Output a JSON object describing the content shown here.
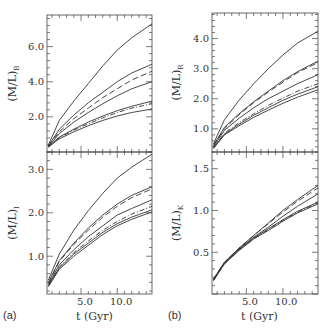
{
  "panels": {
    "a": {
      "label": "(a)",
      "xlabel": "t (Gyr)",
      "xticks": [
        "5.0",
        "10.0"
      ]
    },
    "b": {
      "label": "(b)",
      "xlabel": "t (Gyr)",
      "xticks": [
        "5.0",
        "10.0"
      ]
    }
  },
  "chart_data": [
    {
      "type": "line",
      "panel": "a-top",
      "ylabel": "(M/L)_B",
      "ylabel_main": "(M/L)",
      "ylabel_sub": "B",
      "xlabel": "",
      "yticks": [
        "2.0",
        "4.0",
        "6.0"
      ],
      "xlim": [
        0.3,
        14.8
      ],
      "ylim": [
        0.0,
        7.8
      ],
      "grid": false,
      "x": [
        0.5,
        2,
        4,
        6,
        8,
        10,
        12,
        14.8
      ],
      "series": [
        {
          "name": "solid-1",
          "style": "solid",
          "values": [
            0.4,
            1.8,
            2.9,
            3.9,
            4.9,
            5.8,
            6.5,
            7.3
          ]
        },
        {
          "name": "solid-2",
          "style": "solid",
          "values": [
            0.35,
            1.3,
            2.1,
            2.8,
            3.4,
            4.0,
            4.5,
            5.0
          ]
        },
        {
          "name": "dashed-1",
          "style": "dashed",
          "values": [
            0.35,
            1.15,
            1.9,
            2.5,
            3.1,
            3.6,
            4.1,
            4.6
          ]
        },
        {
          "name": "solid-3",
          "style": "solid",
          "values": [
            0.3,
            1.05,
            1.7,
            2.25,
            2.75,
            3.2,
            3.6,
            4.0
          ]
        },
        {
          "name": "solid-4",
          "style": "solid",
          "values": [
            0.3,
            0.85,
            1.3,
            1.7,
            2.05,
            2.35,
            2.6,
            2.9
          ]
        },
        {
          "name": "dashdot-1",
          "style": "dashdot",
          "values": [
            0.3,
            0.8,
            1.25,
            1.6,
            1.95,
            2.25,
            2.5,
            2.75
          ]
        },
        {
          "name": "solid-5",
          "style": "solid",
          "values": [
            0.28,
            0.75,
            1.15,
            1.5,
            1.8,
            2.05,
            2.25,
            2.45
          ]
        }
      ]
    },
    {
      "type": "line",
      "panel": "a-bottom",
      "ylabel": "(M/L)_I",
      "ylabel_main": "(M/L)",
      "ylabel_sub": "I",
      "xlabel": "t (Gyr)",
      "yticks": [
        "1.0",
        "2.0",
        "3.0"
      ],
      "xticks": [
        "5.0",
        "10.0"
      ],
      "xlim": [
        0.3,
        14.8
      ],
      "ylim": [
        0.13,
        3.4
      ],
      "grid": false,
      "x": [
        0.5,
        2,
        4,
        6,
        8,
        10,
        12,
        14.8
      ],
      "series": [
        {
          "name": "solid-1",
          "style": "solid",
          "values": [
            0.45,
            1.05,
            1.6,
            2.05,
            2.45,
            2.8,
            3.05,
            3.35
          ]
        },
        {
          "name": "solid-2",
          "style": "solid",
          "values": [
            0.4,
            0.9,
            1.3,
            1.65,
            1.95,
            2.2,
            2.4,
            2.6
          ]
        },
        {
          "name": "dashed-1",
          "style": "dashed",
          "values": [
            0.38,
            0.88,
            1.27,
            1.6,
            1.9,
            2.15,
            2.35,
            2.55
          ]
        },
        {
          "name": "solid-3",
          "style": "solid",
          "values": [
            0.35,
            0.8,
            1.15,
            1.45,
            1.7,
            1.95,
            2.1,
            2.3
          ]
        },
        {
          "name": "dashdot-1",
          "style": "dashdot",
          "values": [
            0.33,
            0.75,
            1.08,
            1.35,
            1.6,
            1.8,
            1.97,
            2.15
          ]
        },
        {
          "name": "solid-4",
          "style": "solid",
          "values": [
            0.32,
            0.73,
            1.05,
            1.3,
            1.55,
            1.75,
            1.9,
            2.07
          ]
        },
        {
          "name": "solid-5",
          "style": "solid",
          "values": [
            0.3,
            0.7,
            1.0,
            1.25,
            1.5,
            1.7,
            1.85,
            2.02
          ]
        }
      ]
    },
    {
      "type": "line",
      "panel": "b-top",
      "ylabel": "(M/L)_R",
      "ylabel_main": "(M/L)",
      "ylabel_sub": "R",
      "xlabel": "",
      "yticks": [
        "1.0",
        "2.0",
        "3.0",
        "4.0"
      ],
      "xlim": [
        0.3,
        14.8
      ],
      "ylim": [
        0.23,
        4.85
      ],
      "grid": false,
      "x": [
        0.5,
        2,
        4,
        6,
        8,
        10,
        12,
        14.8
      ],
      "series": [
        {
          "name": "solid-1",
          "style": "solid",
          "values": [
            0.5,
            1.3,
            1.95,
            2.5,
            3.0,
            3.45,
            3.85,
            4.25
          ]
        },
        {
          "name": "solid-2",
          "style": "solid",
          "values": [
            0.45,
            1.05,
            1.5,
            1.9,
            2.25,
            2.6,
            2.9,
            3.25
          ]
        },
        {
          "name": "dashed-1",
          "style": "dashed",
          "values": [
            0.45,
            1.0,
            1.47,
            1.87,
            2.22,
            2.55,
            2.87,
            3.2
          ]
        },
        {
          "name": "solid-3",
          "style": "solid",
          "values": [
            0.4,
            0.95,
            1.35,
            1.7,
            2.0,
            2.25,
            2.5,
            2.8
          ]
        },
        {
          "name": "dashdot-1",
          "style": "dashdot",
          "values": [
            0.38,
            0.85,
            1.2,
            1.5,
            1.78,
            2.02,
            2.25,
            2.5
          ]
        },
        {
          "name": "solid-4",
          "style": "solid",
          "values": [
            0.36,
            0.82,
            1.15,
            1.45,
            1.7,
            1.95,
            2.15,
            2.4
          ]
        },
        {
          "name": "solid-5",
          "style": "solid",
          "values": [
            0.35,
            0.8,
            1.1,
            1.38,
            1.62,
            1.85,
            2.05,
            2.3
          ]
        }
      ]
    },
    {
      "type": "line",
      "panel": "b-bottom",
      "ylabel": "(M/L)_K",
      "ylabel_main": "(M/L)",
      "ylabel_sub": "K",
      "xlabel": "t (Gyr)",
      "yticks": [
        "0.5",
        "1.0",
        "1.5"
      ],
      "xticks": [
        "5.0",
        "10.0"
      ],
      "xlim": [
        0.3,
        14.8
      ],
      "ylim": [
        0.0,
        1.7
      ],
      "grid": false,
      "x": [
        0.5,
        2,
        4,
        6,
        8,
        10,
        12,
        14.8
      ],
      "series": [
        {
          "name": "solid-1",
          "style": "solid",
          "values": [
            0.18,
            0.38,
            0.55,
            0.7,
            0.85,
            1.0,
            1.13,
            1.3
          ]
        },
        {
          "name": "dashed-1",
          "style": "dashed",
          "values": [
            0.18,
            0.38,
            0.55,
            0.7,
            0.84,
            0.98,
            1.11,
            1.27
          ]
        },
        {
          "name": "solid-2",
          "style": "solid",
          "values": [
            0.17,
            0.37,
            0.54,
            0.68,
            0.8,
            0.93,
            1.05,
            1.2
          ]
        },
        {
          "name": "solid-3",
          "style": "solid",
          "values": [
            0.17,
            0.37,
            0.53,
            0.67,
            0.78,
            0.89,
            0.99,
            1.1
          ]
        },
        {
          "name": "dashdot-1",
          "style": "dashdot",
          "values": [
            0.16,
            0.36,
            0.53,
            0.66,
            0.77,
            0.88,
            0.98,
            1.09
          ]
        },
        {
          "name": "solid-4",
          "style": "solid",
          "values": [
            0.16,
            0.36,
            0.52,
            0.66,
            0.76,
            0.87,
            0.97,
            1.08
          ]
        }
      ]
    }
  ]
}
